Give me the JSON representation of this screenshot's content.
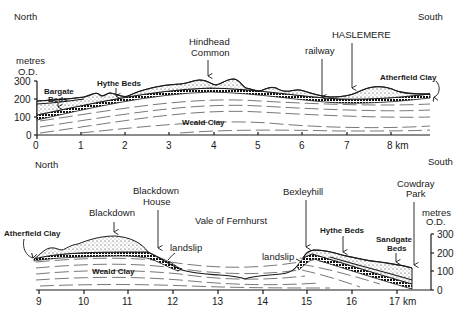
{
  "top_section": {
    "direction_left": "North",
    "direction_right": "South",
    "y_axis_title_line1": "metres",
    "y_axis_title_line2": "O.D.",
    "y_ticks": [
      "300",
      "200",
      "100",
      "0"
    ],
    "x_ticks": [
      "0",
      "1",
      "2",
      "3",
      "4",
      "5",
      "6",
      "7",
      "8 km"
    ],
    "labels": {
      "bargate_line1": "Bargate",
      "bargate_line2": "Beds",
      "hythe": "Hythe Beds",
      "hindhead_line1": "Hindhead",
      "hindhead_line2": "Common",
      "railway": "railway",
      "haslemere": "HASLEMERE",
      "atherfield": "Atherfield Clay",
      "weald": "Weald Clay"
    }
  },
  "bottom_section": {
    "direction_left": "North",
    "direction_right": "South",
    "y_axis_title_line1": "metres",
    "y_axis_title_line2": "O.D.",
    "y_ticks": [
      "300",
      "200",
      "100",
      "0"
    ],
    "x_ticks": [
      "9",
      "10",
      "11",
      "12",
      "13",
      "14",
      "15",
      "16",
      "17 km"
    ],
    "labels": {
      "atherfield": "Atherfield Clay",
      "blackdown": "Blackdown",
      "blackdown_house_line1": "Blackdown",
      "blackdown_house_line2": "House",
      "landslip_left": "landslip",
      "vale": "Vale of Fernhurst",
      "bexleyhill": "Bexleyhill",
      "landslip_right": "landslip",
      "hythe": "Hythe Beds",
      "sandgate_line1": "Sandgate",
      "sandgate_line2": "Beds",
      "cowdray_line1": "Cowdray",
      "cowdray_line2": "Park",
      "weald": "Weald Clay"
    }
  },
  "colors": {
    "ink": "#1a1a1a",
    "background": "#ffffff"
  }
}
